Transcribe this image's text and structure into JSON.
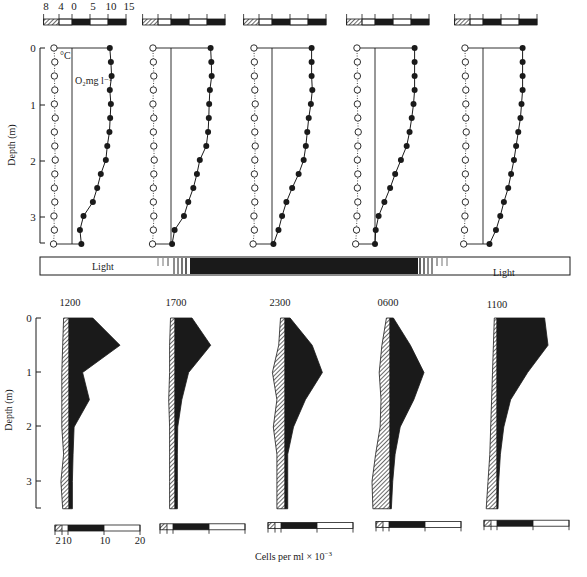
{
  "chart_data": [
    {
      "type": "line",
      "title": "Vertical profiles of temperature and dissolved oxygen",
      "ylabel": "Depth (m)",
      "yticks": [
        "0",
        "1",
        "2",
        "3"
      ],
      "ylim": [
        0,
        3.5
      ],
      "scale_bar": {
        "tick_labels": [
          "8",
          "4",
          "0",
          "5",
          "10",
          "15"
        ],
        "temperature_segment": "hatched (8–4, 4–0 °C)",
        "oxygen_segment": "0–15 mg l⁻¹"
      },
      "series_labels": {
        "temperature": "°C",
        "oxygen": "O₂mg l⁻¹"
      },
      "depth": [
        0,
        0.25,
        0.5,
        0.75,
        1.0,
        1.25,
        1.5,
        1.75,
        2.0,
        2.25,
        2.5,
        2.75,
        3.0,
        3.25,
        3.5
      ],
      "panels": [
        {
          "time": "1200",
          "temperature": [
            4.2,
            4.0,
            4.1,
            4.0,
            4.1,
            3.9,
            4.1,
            4.0,
            3.9,
            4.0,
            4.1,
            4.0,
            4.2,
            4.1,
            4.3
          ],
          "oxygen": [
            10.5,
            10.8,
            11.0,
            10.5,
            10.8,
            10.6,
            10.4,
            9.8,
            9.4,
            8.0,
            7.0,
            5.8,
            3.2,
            2.2,
            2.6
          ]
        },
        {
          "time": "1700",
          "temperature": [
            4.2,
            4.1,
            4.0,
            4.1,
            4.2,
            4.0,
            4.1,
            4.0,
            3.9,
            4.0,
            4.1,
            4.1,
            4.0,
            4.1,
            4.3
          ],
          "oxygen": [
            11.0,
            11.2,
            11.3,
            10.8,
            10.6,
            10.5,
            10.3,
            9.8,
            8.0,
            7.2,
            6.2,
            4.8,
            3.6,
            1.0,
            0.3
          ]
        },
        {
          "time": "2300",
          "temperature": [
            4.2,
            4.1,
            4.1,
            4.0,
            3.9,
            4.1,
            4.0,
            3.9,
            4.0,
            4.1,
            4.0,
            4.0,
            4.2,
            4.1,
            4.4
          ],
          "oxygen": [
            11.0,
            11.0,
            11.0,
            11.2,
            10.8,
            10.2,
            9.8,
            9.4,
            8.8,
            7.4,
            5.6,
            4.0,
            2.8,
            1.8,
            0.4
          ]
        },
        {
          "time": "0600",
          "temperature": [
            4.2,
            4.1,
            4.1,
            4.1,
            4.1,
            4.0,
            3.9,
            4.0,
            4.1,
            4.0,
            4.1,
            4.0,
            4.2,
            4.3,
            4.5
          ],
          "oxygen": [
            11.0,
            11.0,
            11.0,
            11.0,
            10.7,
            10.2,
            9.6,
            8.8,
            7.2,
            5.6,
            4.2,
            2.6,
            1.0,
            0.2,
            0.0
          ]
        },
        {
          "time": "1100",
          "temperature": [
            4.2,
            4.1,
            4.1,
            4.0,
            4.0,
            4.0,
            3.9,
            4.0,
            4.1,
            4.1,
            4.0,
            4.1,
            4.2,
            4.3,
            4.5
          ],
          "oxygen": [
            11.0,
            11.0,
            11.0,
            11.0,
            10.7,
            10.4,
            9.8,
            9.2,
            8.6,
            7.8,
            7.0,
            5.8,
            4.8,
            3.6,
            1.8
          ]
        }
      ]
    },
    {
      "type": "bar",
      "description": "Light/dark regime across sampling period",
      "segments": [
        "Light",
        "transition",
        "Dark",
        "transition",
        "Light"
      ],
      "labels": [
        "Light",
        "Light"
      ]
    },
    {
      "type": "area",
      "title": "Vertical distribution of algal cells (kite diagrams)",
      "ylabel": "Depth (m)",
      "xlabel": "Cells per ml × 10⁻³",
      "yticks": [
        "0",
        "1",
        "2",
        "3"
      ],
      "ylim": [
        0,
        3.5
      ],
      "scale_bar_ticks": [
        "2",
        "1",
        "0",
        "10",
        "20"
      ],
      "series_legend": {
        "hatched": "left-side population (0–2 × 10³ cells/ml)",
        "solid": "right-side population (0–20 × 10³ cells/ml)"
      },
      "depth": [
        0,
        0.5,
        1.0,
        1.5,
        2.0,
        2.5,
        3.0,
        3.5
      ],
      "panels": [
        {
          "time": "1200",
          "hatched": [
            0.6,
            0.7,
            0.8,
            0.8,
            0.8,
            0.6,
            0.9,
            0.7
          ],
          "solid": [
            7,
            15,
            4,
            6,
            1.5,
            1.2,
            1.0,
            1.0
          ]
        },
        {
          "time": "1700",
          "hatched": [
            0.5,
            0.6,
            0.6,
            0.7,
            0.6,
            0.6,
            0.6,
            0.6
          ],
          "solid": [
            5,
            10.5,
            4,
            2,
            0.8,
            0.7,
            0.7,
            0.7
          ]
        },
        {
          "time": "2300",
          "hatched": [
            0.5,
            0.7,
            1.4,
            0.9,
            1.3,
            0.9,
            0.9,
            0.9
          ],
          "solid": [
            1.5,
            8,
            11,
            6,
            2.5,
            0.8,
            0.8,
            0.8
          ]
        },
        {
          "time": "0600",
          "hatched": [
            0.4,
            0.9,
            1.2,
            1.0,
            1.1,
            1.6,
            2.0,
            1.9
          ],
          "solid": [
            1,
            6,
            10,
            7,
            3,
            1.5,
            0.8,
            0.4
          ]
        },
        {
          "time": "1100",
          "hatched": [
            0.3,
            0.4,
            0.5,
            0.6,
            0.7,
            0.8,
            1.0,
            1.2
          ],
          "solid": [
            14,
            15,
            9,
            4,
            2,
            1,
            0.5,
            0.3
          ]
        }
      ]
    }
  ],
  "figure": {
    "top_scale_labels": [
      "8",
      "4",
      "0",
      "5",
      "10",
      "15"
    ],
    "temp_label": "°C",
    "oxygen_label": "O₂mg l⁻¹",
    "depth_axis_label": "Depth (m)",
    "depth_ticks": [
      "0",
      "1",
      "2",
      "3"
    ],
    "light_left": "Light",
    "light_right": "Light",
    "times": [
      "1200",
      "1700",
      "2300",
      "0600",
      "1100"
    ],
    "bottom_scale_labels": [
      "2",
      "1",
      "0",
      "10",
      "20"
    ],
    "cells_label": "Cells per ml × 10",
    "cells_exp": "−3"
  }
}
